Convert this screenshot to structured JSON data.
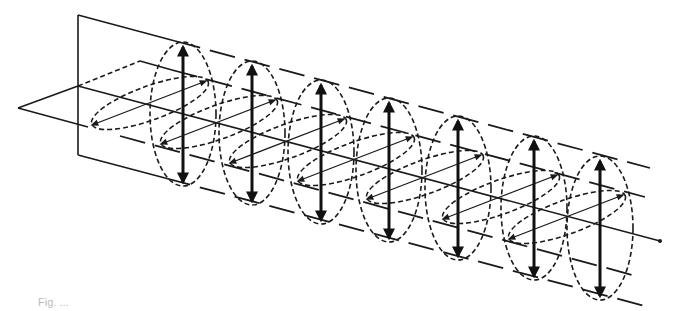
{
  "figure": {
    "caption_visible": "Fig. ...",
    "colors": {
      "ink": "#1a1a1a",
      "background": "#ffffff"
    },
    "vertical_arrows": [
      {
        "x": 183,
        "y1": 44,
        "y2": 185
      },
      {
        "x": 251,
        "y1": 63,
        "y2": 203
      },
      {
        "x": 320,
        "y1": 82,
        "y2": 222
      },
      {
        "x": 389,
        "y1": 100,
        "y2": 240
      },
      {
        "x": 458,
        "y1": 118,
        "y2": 258
      },
      {
        "x": 534,
        "y1": 138,
        "y2": 276
      },
      {
        "x": 600,
        "y1": 158,
        "y2": 293
      }
    ],
    "horizontal_arrow_count": 7,
    "planes": [
      "vertical-plane",
      "horizontal-plane"
    ]
  }
}
